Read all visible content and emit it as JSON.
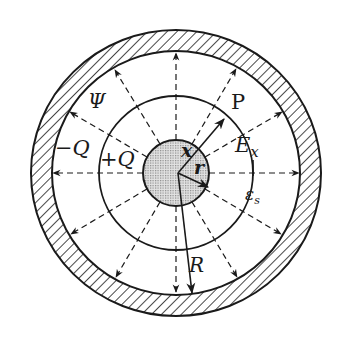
{
  "diagram": {
    "type": "concentric-sphere-capacitor",
    "colors": {
      "stroke": "#1a1a1a",
      "core_fill": "#cfcfcf",
      "background": "#ffffff"
    },
    "labels": {
      "psi": "Ψ",
      "neg_q": "−Q",
      "pos_q": "+Q",
      "p": "P",
      "e": "E",
      "e_sub": "x",
      "x": "x",
      "r": "r",
      "eps": "ε",
      "eps_sub": "s",
      "big_r": "R"
    },
    "geometry": {
      "center": [
        176,
        173
      ],
      "outer_shell_outer_radius": 143,
      "outer_shell_inner_radius": 123,
      "gaussian_surface_radius": 77,
      "core_radius": 33
    },
    "field_lines": {
      "count": 12,
      "style": "dashed",
      "direction": "radially outward"
    }
  }
}
